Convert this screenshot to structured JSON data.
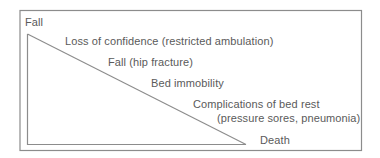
{
  "diagram": {
    "type": "decline-cascade",
    "colors": {
      "frame": "#8c8c8c",
      "triangle": "#8c8c8c",
      "text": "#5a5a5a",
      "background": "#ffffff"
    },
    "top_label": "Fall",
    "steps": [
      {
        "label": "Loss of confidence (restricted ambulation)"
      },
      {
        "label": "Fall (hip fracture)"
      },
      {
        "label": "Bed immobility"
      },
      {
        "label": "Complications of bed rest"
      },
      {
        "label": "(pressure sores, pneumonia)"
      }
    ],
    "end_label": "Death"
  }
}
